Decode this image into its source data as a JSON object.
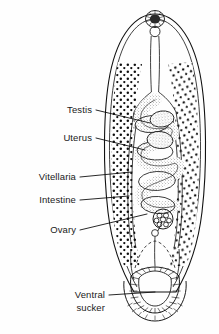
{
  "figure": {
    "kind": "anatomical-line-drawing",
    "background_color": "#fefefe",
    "ink_color": "#111111",
    "label_color": "#1a1a1a"
  },
  "labels": [
    {
      "id": "testis",
      "text": "Testis",
      "x": 92,
      "y": 113,
      "leader": "M96,110 L150,123"
    },
    {
      "id": "uterus",
      "text": "Uterus",
      "x": 92,
      "y": 141,
      "leader": "M96,138 L145,150"
    },
    {
      "id": "vitellaria",
      "text": "Vitellaria",
      "x": 76,
      "y": 180,
      "leader": "M80,177 L132,172"
    },
    {
      "id": "intestine",
      "text": "Intestine",
      "x": 76,
      "y": 203,
      "leader": "M80,200 L129,196"
    },
    {
      "id": "ovary",
      "text": "Ovary",
      "x": 76,
      "y": 233,
      "leader": "M80,230 L147,214"
    },
    {
      "id": "ventral-sucker",
      "text": "Ventral",
      "x": 105,
      "y": 298,
      "leader": "M109,295 L155,292"
    },
    {
      "id": "ventral-sucker-line2",
      "text": "sucker",
      "x": 105,
      "y": 311,
      "leader": ""
    }
  ],
  "structures": [
    {
      "id": "body-outline",
      "name": "body-outline"
    },
    {
      "id": "oral-sucker",
      "name": "oral-sucker"
    },
    {
      "id": "esophagus",
      "name": "esophagus"
    },
    {
      "id": "intestinal-ceca",
      "name": "intestinal-ceca"
    },
    {
      "id": "uterus-coils",
      "name": "uterus-coils"
    },
    {
      "id": "testes",
      "name": "testes"
    },
    {
      "id": "ovary-body",
      "name": "ovary-body"
    },
    {
      "id": "vitellaria-field",
      "name": "vitellaria-field"
    },
    {
      "id": "ventral-sucker-ring",
      "name": "ventral-sucker-ring"
    }
  ]
}
